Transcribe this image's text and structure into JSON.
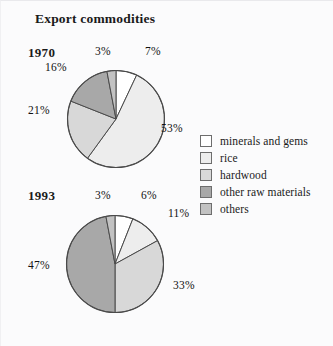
{
  "figure": {
    "title": "Export commodities",
    "background_color": "#fbfbfc"
  },
  "legend": {
    "items": [
      {
        "label": "minerals and gems",
        "color": "#ffffff"
      },
      {
        "label": "rice",
        "color": "#ededed"
      },
      {
        "label": "hardwood",
        "color": "#d8d8d8"
      },
      {
        "label": "other raw materials",
        "color": "#a8a8a8"
      },
      {
        "label": "others",
        "color": "#c2c2c2"
      }
    ]
  },
  "charts": [
    {
      "year": "1970",
      "labels": [
        "7%",
        "53%",
        "21%",
        "16%",
        "3%"
      ]
    },
    {
      "year": "1993",
      "labels": [
        "6%",
        "11%",
        "33%",
        "47%",
        "3%"
      ]
    }
  ],
  "chart_data": [
    {
      "type": "pie",
      "title": "Export commodities",
      "subtitle": "1970",
      "categories": [
        "minerals and gems",
        "rice",
        "hardwood",
        "other raw materials",
        "others"
      ],
      "values": [
        7,
        53,
        21,
        16,
        3
      ],
      "data_labels": [
        "7%",
        "53%",
        "21%",
        "16%",
        "3%"
      ],
      "colors": [
        "#ffffff",
        "#ededed",
        "#d8d8d8",
        "#a8a8a8",
        "#c2c2c2"
      ],
      "units": "percent",
      "start_angle_deg": 0,
      "direction": "clockwise",
      "legend_position": "right",
      "grid": false
    },
    {
      "type": "pie",
      "title": "Export commodities",
      "subtitle": "1993",
      "categories": [
        "minerals and gems",
        "rice",
        "hardwood",
        "other raw materials",
        "others"
      ],
      "values": [
        6,
        11,
        33,
        47,
        3
      ],
      "data_labels": [
        "6%",
        "11%",
        "33%",
        "47%",
        "3%"
      ],
      "colors": [
        "#ffffff",
        "#ededed",
        "#d8d8d8",
        "#a8a8a8",
        "#c2c2c2"
      ],
      "units": "percent",
      "start_angle_deg": 0,
      "direction": "clockwise",
      "legend_position": "right",
      "grid": false
    }
  ]
}
